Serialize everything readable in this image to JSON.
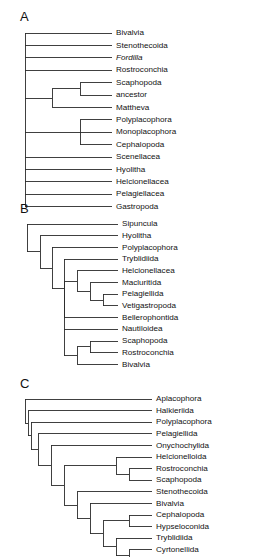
{
  "figure": {
    "background": "#ffffff",
    "line_color": "#2b2b2b",
    "text_color": "#111111"
  },
  "panels": [
    {
      "letter": "A",
      "letter_x": 20,
      "letter_y": 18,
      "root_x": 25,
      "tip_x": 112,
      "label_x": 116,
      "first_tip_y": 33,
      "tip_spacing": 12.4,
      "tips": [
        {
          "label": "Bivalvia",
          "italic": false
        },
        {
          "label": "Stenothecoida",
          "italic": false
        },
        {
          "label": "Fordilla",
          "italic": true
        },
        {
          "label": "Rostroconchia",
          "italic": false
        },
        {
          "label": "Scaphopoda",
          "italic": false
        },
        {
          "label": "ancestor",
          "italic": false
        },
        {
          "label": "Mattheva",
          "italic": false
        },
        {
          "label": "Polyplacophora",
          "italic": false
        },
        {
          "label": "Monoplacophora",
          "italic": false
        },
        {
          "label": "Cephalopoda",
          "italic": false
        },
        {
          "label": "Scenellacea",
          "italic": false
        },
        {
          "label": "Hyolitha",
          "italic": false
        },
        {
          "label": "Helcionellacea",
          "italic": false
        },
        {
          "label": "Pelagiellacea",
          "italic": false
        },
        {
          "label": "Gastropoda",
          "italic": false
        }
      ],
      "clades": [
        {
          "name": "scaphopoda-ancestor-node",
          "x": 80,
          "children_tips": [
            4,
            5
          ]
        },
        {
          "name": "mattheva-clade-node",
          "x": 52,
          "children": [
            {
              "tip": 6
            }
          ],
          "children_nodes": [
            "scaphopoda-ancestor-node"
          ]
        },
        {
          "name": "polyplacophora-clade-node",
          "x": 80,
          "children_tips": [
            7,
            8,
            9
          ]
        }
      ],
      "root_tips": [
        0,
        1,
        2,
        3,
        10,
        11,
        12,
        13,
        14
      ],
      "root_nodes": [
        "mattheva-clade-node",
        "polyplacophora-clade-node"
      ]
    },
    {
      "letter": "B",
      "letter_x": 20,
      "letter_y": 210,
      "root_x": 27,
      "tip_x": 118,
      "label_x": 122,
      "first_tip_y": 224,
      "tip_spacing": 11.7,
      "tips": [
        {
          "label": "Sipuncula",
          "italic": false
        },
        {
          "label": "Hyolitha",
          "italic": false
        },
        {
          "label": "Polyplacophora",
          "italic": false
        },
        {
          "label": "Tryblidiida",
          "italic": false
        },
        {
          "label": "Helcionellacea",
          "italic": false
        },
        {
          "label": "Macluritida",
          "italic": false
        },
        {
          "label": "Pelagiellida",
          "italic": false
        },
        {
          "label": "Vetigastropoda",
          "italic": false
        },
        {
          "label": "Bellerophontida",
          "italic": false
        },
        {
          "label": "Nautiloidea",
          "italic": false
        },
        {
          "label": "Scaphopoda",
          "italic": false
        },
        {
          "label": "Rostroconchia",
          "italic": false
        },
        {
          "label": "Bivalvia",
          "italic": false
        }
      ],
      "ladder_x": [
        27,
        40,
        52,
        64,
        77,
        90
      ],
      "structure": "pectinate"
    },
    {
      "letter": "C",
      "letter_x": 20,
      "letter_y": 385,
      "root_x": 25,
      "tip_x": 152,
      "label_x": 156,
      "first_tip_y": 399,
      "tip_spacing": 11.6,
      "tips": [
        {
          "label": "Aplacophora",
          "italic": false
        },
        {
          "label": "Halkieriida",
          "italic": false
        },
        {
          "label": "Polyplacophora",
          "italic": false
        },
        {
          "label": "Pelagiellida",
          "italic": false
        },
        {
          "label": "Onychochylida",
          "italic": false
        },
        {
          "label": "Helcionelloida",
          "italic": false
        },
        {
          "label": "Rostroconchia",
          "italic": false
        },
        {
          "label": "Scaphopoda",
          "italic": false
        },
        {
          "label": "Stenothecoida",
          "italic": false
        },
        {
          "label": "Bivalvia",
          "italic": false
        },
        {
          "label": "Cephalopoda",
          "italic": false
        },
        {
          "label": "Hypseloconida",
          "italic": false
        },
        {
          "label": "Tryblidiida",
          "italic": false
        },
        {
          "label": "Cyrtonellida",
          "italic": false
        },
        {
          "label": "Gastropoda",
          "italic": false
        }
      ],
      "ladder_x": [
        25,
        38,
        51,
        64,
        77,
        90,
        103,
        116,
        129,
        140
      ],
      "structure": "pectinate"
    }
  ]
}
